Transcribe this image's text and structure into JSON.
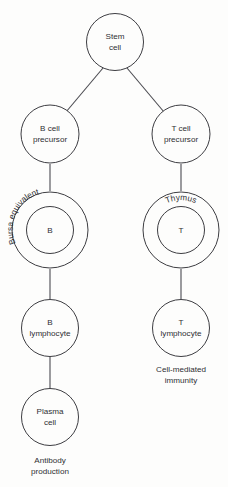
{
  "diagram": {
    "background_color": "#fdfdfc",
    "stroke_color": "#3d3d42",
    "text_color": "#2f2f33",
    "nodes": {
      "stem_cell": {
        "line1": "Stem",
        "line2": "cell"
      },
      "b_cell_precursor": {
        "line1": "B cell",
        "line2": "precursor"
      },
      "t_cell_precursor": {
        "line1": "T cell",
        "line2": "precursor"
      },
      "bursa_equivalent": {
        "ring_label": "Bursa equivalent",
        "inner_label": "B"
      },
      "thymus": {
        "ring_label": "Thymus",
        "inner_label": "T"
      },
      "b_lymphocyte": {
        "line1": "B",
        "line2": "lymphocyte"
      },
      "t_lymphocyte": {
        "line1": "T",
        "line2": "lymphocyte"
      },
      "plasma_cell": {
        "line1": "Plasma",
        "line2": "cell"
      }
    },
    "captions": {
      "cell_mediated": {
        "line1": "Cell-mediated",
        "line2": "immunity"
      },
      "antibody": {
        "line1": "Antibody",
        "line2": "production"
      }
    }
  }
}
